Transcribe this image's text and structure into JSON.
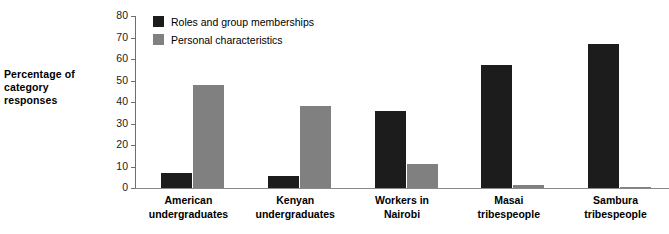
{
  "chart_data": {
    "type": "bar",
    "title": "",
    "xlabel": "",
    "ylabel": "Percentage of category responses",
    "ylim": [
      0,
      80
    ],
    "yticks": [
      0,
      10,
      20,
      30,
      40,
      50,
      60,
      70,
      80
    ],
    "grid": false,
    "legend_position": "top-left-inside",
    "categories": [
      "American undergraduates",
      "Kenyan undergraduates",
      "Workers in Nairobi",
      "Masai tribespeople",
      "Sambura tribespeople"
    ],
    "category_lines": [
      [
        "American",
        "undergraduates"
      ],
      [
        "Kenyan",
        "undergraduates"
      ],
      [
        "Workers in",
        "Nairobi"
      ],
      [
        "Masai",
        "tribespeople"
      ],
      [
        "Sambura",
        "tribespeople"
      ]
    ],
    "series": [
      {
        "name": "Roles and group memberships",
        "color": "#1c1c1c",
        "values": [
          7,
          5.5,
          36,
          57,
          67
        ]
      },
      {
        "name": "Personal characteristics",
        "color": "#808080",
        "values": [
          48,
          38,
          11,
          1.5,
          0.5
        ]
      }
    ]
  },
  "axis": {
    "y_title_lines": [
      "Percentage of",
      "category responses"
    ]
  },
  "colors": {
    "series_roles": "#1c1c1c",
    "series_personal": "#808080",
    "axis_line": "#6e6e6e",
    "background": "#ffffff"
  }
}
